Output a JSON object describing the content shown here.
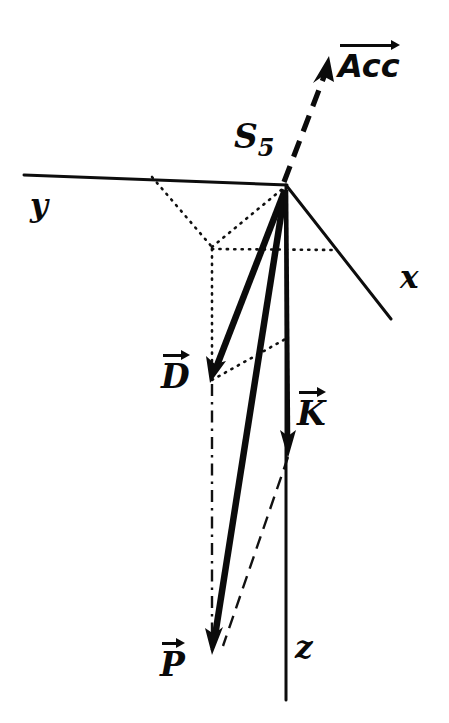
{
  "figure": {
    "background_color": "#ffffff",
    "ink_color": "#0b0b0b",
    "width": 449,
    "height": 723
  },
  "axes": [
    {
      "id": "y-axis",
      "label": "y",
      "label_x": 38,
      "label_y": 186,
      "from": {
        "x": 24,
        "y": 175
      },
      "to": {
        "x": 286,
        "y": 185
      },
      "style": "solid"
    },
    {
      "id": "x-axis",
      "label": "x",
      "label_x": 403,
      "label_y": 263,
      "from": {
        "x": 286,
        "y": 185
      },
      "to": {
        "x": 390,
        "y": 318
      },
      "style": "solid"
    },
    {
      "id": "z-axis",
      "label": "z",
      "label_x": 297,
      "label_y": 637,
      "from": {
        "x": 286,
        "y": 185
      },
      "to": {
        "x": 286,
        "y": 700
      },
      "style": "solid"
    }
  ],
  "origin_point": {
    "id": "point-s5",
    "label_base": "S",
    "label_subscript": "5",
    "label_x": 236,
    "label_y": 122,
    "x": 286,
    "y": 185
  },
  "vectors": [
    {
      "id": "vector-acc",
      "label": "Acc",
      "has_overbar_arrow": true,
      "label_x": 340,
      "label_y": 40,
      "style": "dashed",
      "from": {
        "x": 286,
        "y": 185
      },
      "to": {
        "x": 329,
        "y": 58
      },
      "description": "Acceleration vector pointing up and to the right from S5"
    },
    {
      "id": "vector-d",
      "label": "D",
      "has_overbar_arrow": true,
      "label_x": 163,
      "label_y": 352,
      "style": "solid",
      "from": {
        "x": 286,
        "y": 188
      },
      "to": {
        "x": 212,
        "y": 380
      },
      "description": "Vector D pointing down and to the left from S5"
    },
    {
      "id": "vector-p",
      "label": "P",
      "has_overbar_arrow": true,
      "label_x": 299,
      "label_y": 388,
      "style": "solid",
      "from": {
        "x": 286,
        "y": 188
      },
      "to": {
        "x": 288,
        "y": 455
      },
      "description": "Vector P pointing straight down from S5 along the z direction"
    },
    {
      "id": "vector-k",
      "label": "K",
      "has_overbar_arrow": true,
      "label_x": 163,
      "label_y": 640,
      "style": "solid",
      "from": {
        "x": 286,
        "y": 188
      },
      "to": {
        "x": 212,
        "y": 652
      },
      "description": "Resultant vector K pointing down and slightly left from S5"
    }
  ],
  "construction_lines": [
    {
      "id": "dotted-y-to-corner",
      "style": "dotted",
      "from": {
        "x": 152,
        "y": 177
      },
      "to": {
        "x": 212,
        "y": 247
      }
    },
    {
      "id": "dotted-corner-to-origin",
      "style": "dotted",
      "from": {
        "x": 212,
        "y": 247
      },
      "to": {
        "x": 286,
        "y": 186
      }
    },
    {
      "id": "dotted-corner-horizontal",
      "style": "dotted",
      "from": {
        "x": 212,
        "y": 249
      },
      "to": {
        "x": 337,
        "y": 250
      }
    },
    {
      "id": "dotted-corner-vertical",
      "style": "dotted",
      "from": {
        "x": 212,
        "y": 249
      },
      "to": {
        "x": 212,
        "y": 380
      }
    },
    {
      "id": "dotted-d-to-p-diagonal",
      "style": "dotted",
      "from": {
        "x": 212,
        "y": 380
      },
      "to": {
        "x": 288,
        "y": 337
      }
    },
    {
      "id": "dashdot-d-down-to-k",
      "style": "dash-dot",
      "from": {
        "x": 212,
        "y": 382
      },
      "to": {
        "x": 212,
        "y": 650
      }
    },
    {
      "id": "dashed-p-down-to-k",
      "style": "dashed",
      "from": {
        "x": 288,
        "y": 455
      },
      "to": {
        "x": 222,
        "y": 646
      }
    }
  ]
}
